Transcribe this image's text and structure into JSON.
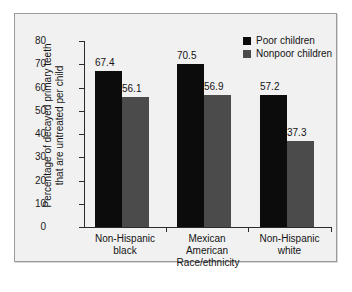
{
  "chart_data": {
    "type": "bar",
    "title": "",
    "xlabel": "Race/ethnicity",
    "ylabel": "Percentage of decayed primary teeth that are untreated per child",
    "ylabel_line1": "Percentage of decayed primary teeth",
    "ylabel_line2": "that are untreated per child",
    "categories": [
      "Non-Hispanic black",
      "Mexican American",
      "Non-Hispanic white"
    ],
    "category_lines": [
      [
        "Non-Hispanic",
        "black"
      ],
      [
        "Mexican",
        "American"
      ],
      [
        "Non-Hispanic",
        "white"
      ]
    ],
    "series": [
      {
        "name": "Poor children",
        "color": "#0c0c0c",
        "values": [
          67.4,
          70.5,
          57.2
        ]
      },
      {
        "name": "Nonpoor children",
        "color": "#4b4b4b",
        "values": [
          56.1,
          56.9,
          37.3
        ]
      }
    ],
    "value_labels": [
      [
        "67.4",
        "56.1"
      ],
      [
        "70.5",
        "56.9"
      ],
      [
        "57.2",
        "37.3"
      ]
    ],
    "ylim": [
      0,
      80
    ],
    "yticks": [
      0,
      10,
      20,
      30,
      40,
      50,
      60,
      70,
      80
    ],
    "ytick_labels": [
      "0",
      "10",
      "20",
      "30",
      "40",
      "50",
      "60",
      "70",
      "80"
    ],
    "grid": false,
    "legend_position": "top-right"
  },
  "legend": {
    "entries": [
      {
        "label": "Poor children",
        "swatch": "poor-swatch-icon"
      },
      {
        "label": "Nonpoor children",
        "swatch": "nonpoor-swatch-icon"
      }
    ]
  }
}
